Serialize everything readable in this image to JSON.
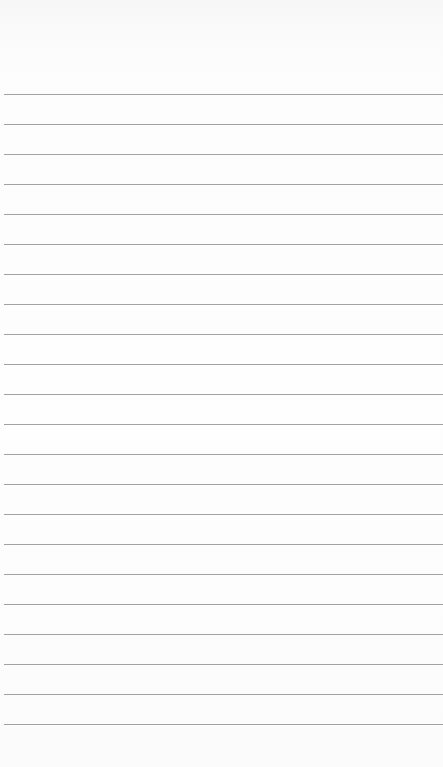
{
  "notepad": {
    "background_color": "#fdfdfd",
    "rule_color": "#a2a2a2",
    "first_rule_y": 94,
    "rule_spacing": 30,
    "rule_count": 22,
    "lines": [
      "",
      "",
      "",
      "",
      "",
      "",
      "",
      "",
      "",
      "",
      "",
      "",
      "",
      "",
      "",
      "",
      "",
      "",
      "",
      "",
      "",
      ""
    ]
  }
}
